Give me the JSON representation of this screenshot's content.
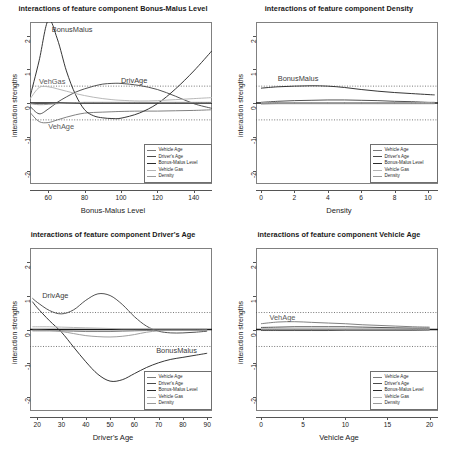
{
  "figure": {
    "layout": "2x2 grid of line charts",
    "ylabel": "interaction strengths",
    "legend_entries": [
      "Vehicle Age",
      "Driver's Age",
      "Bonus-Malus Level",
      "Vehicle Gas",
      "Density"
    ],
    "legend_colors": [
      "#7a7a7a",
      "#4a4a4a",
      "#2b2b2b",
      "#b4b4b4",
      "#9a9a9a"
    ],
    "yticks": [
      "2",
      "1",
      "0",
      "-1",
      "-2"
    ],
    "ylim": [
      -2.4,
      2.4
    ],
    "ref_lines": [
      0.5,
      -0.5
    ],
    "zero_line": 0
  },
  "chart_data": [
    {
      "type": "line",
      "title": "interactions of feature component Bonus-Malus Level",
      "xlabel": "Bonus-Malus Level",
      "ylabel": "interaction strengths",
      "xlim": [
        50,
        150
      ],
      "ylim": [
        -2.4,
        2.4
      ],
      "xticks": [
        "60",
        "80",
        "100",
        "120",
        "140"
      ],
      "yticks": [
        "2",
        "1",
        "0",
        "-1",
        "-2"
      ],
      "grid": false,
      "legend_position": "bottom-right",
      "annotations": [
        {
          "text": "BonusMalus",
          "x": 62,
          "y": 2.15
        },
        {
          "text": "VehGas",
          "x": 55,
          "y": 0.62
        },
        {
          "text": "DrivAge",
          "x": 100,
          "y": 0.66
        },
        {
          "text": "VehAge",
          "x": 60,
          "y": -0.72
        }
      ],
      "x": [
        50,
        55,
        60,
        65,
        70,
        75,
        80,
        85,
        90,
        95,
        100,
        110,
        120,
        130,
        140,
        150
      ],
      "series": [
        {
          "name": "Vehicle Age",
          "color": "#7a7a7a",
          "values": [
            -0.28,
            -0.55,
            -0.58,
            -0.5,
            -0.42,
            -0.35,
            -0.3,
            -0.28,
            -0.27,
            -0.26,
            -0.25,
            -0.24,
            -0.24,
            -0.23,
            -0.22,
            -0.2
          ]
        },
        {
          "name": "Driver's Age",
          "color": "#4a4a4a",
          "values": [
            -0.1,
            -0.32,
            -0.18,
            0.02,
            0.18,
            0.32,
            0.42,
            0.5,
            0.56,
            0.58,
            0.58,
            0.52,
            0.4,
            0.2,
            -0.02,
            -0.16
          ]
        },
        {
          "name": "Bonus-Malus Level",
          "color": "#2b2b2b",
          "values": [
            0.18,
            1.25,
            2.45,
            1.9,
            0.95,
            0.25,
            -0.2,
            -0.38,
            -0.44,
            -0.46,
            -0.45,
            -0.3,
            -0.02,
            0.42,
            0.95,
            1.55
          ]
        },
        {
          "name": "Vehicle Gas",
          "color": "#b4b4b4",
          "values": [
            0.12,
            0.46,
            0.48,
            0.42,
            0.35,
            0.28,
            0.22,
            0.17,
            0.13,
            0.1,
            0.08,
            0.06,
            0.07,
            0.1,
            0.13,
            0.16
          ]
        },
        {
          "name": "Density",
          "color": "#9a9a9a",
          "values": [
            -0.02,
            -0.05,
            -0.04,
            -0.02,
            0.0,
            0.01,
            0.02,
            0.02,
            0.02,
            0.02,
            0.02,
            0.02,
            0.02,
            0.02,
            0.02,
            0.02
          ]
        }
      ]
    },
    {
      "type": "line",
      "title": "interactions of feature component Density",
      "xlabel": "Density",
      "ylabel": "interaction strengths",
      "xlim": [
        -0.3,
        10.6
      ],
      "ylim": [
        -2.4,
        2.4
      ],
      "xticks": [
        "0",
        "2",
        "4",
        "6",
        "8",
        "10"
      ],
      "yticks": [
        "2",
        "1",
        "0",
        "-1",
        "-2"
      ],
      "grid": false,
      "legend_position": "bottom-right",
      "annotations": [
        {
          "text": "BonusMalus",
          "x": 1.0,
          "y": 0.7
        }
      ],
      "x": [
        0,
        1,
        2,
        3,
        4,
        5,
        6,
        7,
        8,
        9,
        10,
        10.4
      ],
      "series": [
        {
          "name": "Vehicle Age",
          "color": "#7a7a7a",
          "values": [
            -0.03,
            -0.02,
            -0.02,
            -0.02,
            -0.02,
            -0.02,
            -0.02,
            -0.02,
            -0.02,
            -0.02,
            -0.02,
            -0.02
          ]
        },
        {
          "name": "Driver's Age",
          "color": "#4a4a4a",
          "values": [
            0.02,
            0.05,
            0.07,
            0.08,
            0.09,
            0.09,
            0.08,
            0.07,
            0.05,
            0.04,
            0.02,
            0.02
          ]
        },
        {
          "name": "Bonus-Malus Level",
          "color": "#2b2b2b",
          "values": [
            0.44,
            0.48,
            0.5,
            0.51,
            0.5,
            0.46,
            0.4,
            0.35,
            0.31,
            0.28,
            0.25,
            0.24
          ]
        },
        {
          "name": "Vehicle Gas",
          "color": "#b4b4b4",
          "values": [
            0.01,
            0.01,
            0.01,
            0.01,
            0.01,
            0.01,
            0.01,
            0.01,
            0.01,
            0.01,
            0.01,
            0.01
          ]
        },
        {
          "name": "Density",
          "color": "#9a9a9a",
          "values": [
            -0.01,
            -0.01,
            -0.01,
            -0.01,
            -0.01,
            -0.01,
            -0.01,
            -0.01,
            -0.01,
            -0.01,
            -0.01,
            -0.01
          ]
        }
      ]
    },
    {
      "type": "line",
      "title": "interactions of feature component Driver's Age",
      "xlabel": "Driver's Age",
      "ylabel": "interaction strengths",
      "xlim": [
        17,
        92
      ],
      "ylim": [
        -2.4,
        2.4
      ],
      "xticks": [
        "20",
        "30",
        "40",
        "50",
        "60",
        "70",
        "80",
        "90"
      ],
      "yticks": [
        "2",
        "1",
        "0",
        "-1",
        "-2"
      ],
      "grid": false,
      "legend_position": "bottom-right",
      "annotations": [
        {
          "text": "DrivAge",
          "x": 22,
          "y": 0.98
        },
        {
          "text": "BonusMalus",
          "x": 69,
          "y": -0.62
        }
      ],
      "x": [
        18,
        20,
        25,
        30,
        35,
        40,
        45,
        50,
        55,
        60,
        65,
        70,
        75,
        80,
        85,
        90
      ],
      "series": [
        {
          "name": "Vehicle Age",
          "color": "#7a7a7a",
          "values": [
            -0.04,
            -0.04,
            -0.04,
            -0.04,
            -0.05,
            -0.06,
            -0.06,
            -0.06,
            -0.05,
            -0.04,
            -0.03,
            -0.02,
            -0.02,
            -0.02,
            -0.02,
            -0.02
          ]
        },
        {
          "name": "Driver's Age",
          "color": "#4a4a4a",
          "values": [
            0.92,
            0.8,
            0.56,
            0.46,
            0.58,
            0.86,
            1.05,
            1.0,
            0.74,
            0.38,
            0.1,
            -0.05,
            -0.1,
            -0.1,
            -0.08,
            -0.05
          ]
        },
        {
          "name": "Bonus-Malus Level",
          "color": "#2b2b2b",
          "values": [
            0.82,
            0.64,
            0.26,
            -0.08,
            -0.52,
            -0.95,
            -1.32,
            -1.52,
            -1.48,
            -1.3,
            -1.12,
            -0.98,
            -0.88,
            -0.82,
            -0.76,
            -0.7
          ]
        },
        {
          "name": "Vehicle Gas",
          "color": "#b4b4b4",
          "values": [
            0.08,
            0.08,
            0.08,
            0.07,
            0.06,
            0.05,
            0.04,
            0.03,
            0.02,
            0.02,
            0.02,
            0.02,
            0.02,
            0.02,
            0.02,
            0.02
          ]
        },
        {
          "name": "Density",
          "color": "#9a9a9a",
          "values": [
            -0.02,
            -0.02,
            -0.03,
            -0.06,
            -0.12,
            -0.18,
            -0.21,
            -0.22,
            -0.2,
            -0.15,
            -0.08,
            -0.04,
            -0.03,
            -0.03,
            -0.03,
            -0.02
          ]
        }
      ]
    },
    {
      "type": "line",
      "title": "interactions of feature component Vehicle Age",
      "xlabel": "Vehicle Age",
      "ylabel": "interaction strengths",
      "xlim": [
        -0.6,
        21
      ],
      "ylim": [
        -2.4,
        2.4
      ],
      "xticks": [
        "0",
        "5",
        "10",
        "15",
        "20"
      ],
      "yticks": [
        "2",
        "1",
        "0",
        "-1",
        "-2"
      ],
      "grid": false,
      "legend_position": "bottom-right",
      "annotations": [
        {
          "text": "VehAge",
          "x": 1.0,
          "y": 0.33
        }
      ],
      "x": [
        0,
        2,
        4,
        6,
        8,
        10,
        12,
        14,
        16,
        18,
        20
      ],
      "series": [
        {
          "name": "Vehicle Age",
          "color": "#7a7a7a",
          "values": [
            0.17,
            0.22,
            0.23,
            0.21,
            0.19,
            0.17,
            0.14,
            0.12,
            0.1,
            0.08,
            0.07
          ]
        },
        {
          "name": "Driver's Age",
          "color": "#4a4a4a",
          "values": [
            0.06,
            0.07,
            0.08,
            0.08,
            0.08,
            0.08,
            0.07,
            0.06,
            0.05,
            0.04,
            0.04
          ]
        },
        {
          "name": "Bonus-Malus Level",
          "color": "#2b2b2b",
          "values": [
            -0.03,
            -0.03,
            -0.03,
            -0.03,
            -0.03,
            -0.02,
            -0.02,
            -0.02,
            -0.02,
            -0.02,
            -0.01
          ]
        },
        {
          "name": "Vehicle Gas",
          "color": "#b4b4b4",
          "values": [
            0.01,
            0.01,
            0.01,
            0.01,
            0.01,
            0.01,
            0.01,
            0.01,
            0.01,
            0.01,
            0.01
          ]
        },
        {
          "name": "Density",
          "color": "#9a9a9a",
          "values": [
            -0.01,
            -0.01,
            -0.01,
            -0.01,
            -0.01,
            -0.01,
            -0.01,
            -0.01,
            -0.01,
            -0.01,
            -0.01
          ]
        }
      ]
    }
  ]
}
